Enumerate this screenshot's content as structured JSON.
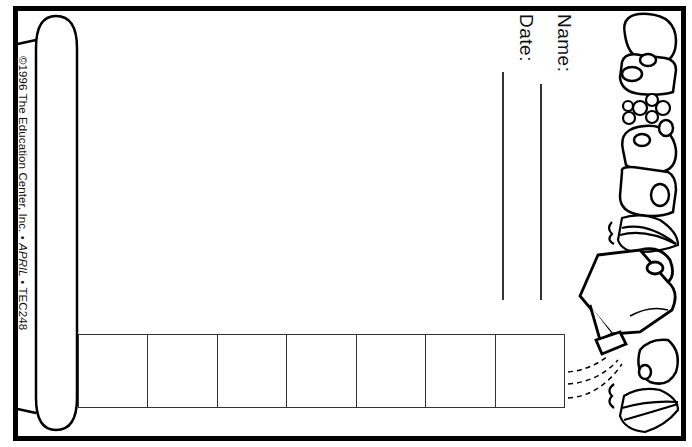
{
  "worksheet": {
    "fields": [
      {
        "label": "Name:",
        "line_value": ""
      },
      {
        "label": "Date:",
        "line_value": ""
      }
    ],
    "copyright": {
      "prefix": "©1996 The Education Center, Inc. • ",
      "month": "APRIL",
      "suffix": " • TEC248"
    },
    "answer_boxes": {
      "count": 7,
      "values": [
        "",
        "",
        "",
        "",
        "",
        "",
        ""
      ]
    },
    "illustration": {
      "description": "watering can with flowers and onion bulbs along right border",
      "icons": [
        "flower-icon",
        "watering-can-icon",
        "onion-icon",
        "water-drops-icon"
      ]
    },
    "colors": {
      "ink": "#000000",
      "paper": "#ffffff"
    }
  }
}
